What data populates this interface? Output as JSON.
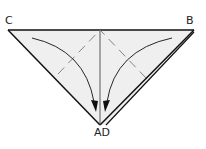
{
  "diagram": {
    "type": "origami-fold-step",
    "labels": {
      "c": "C",
      "b": "B",
      "ad": "AD"
    },
    "colors": {
      "paper": "#efefef",
      "line": "#111111"
    }
  }
}
